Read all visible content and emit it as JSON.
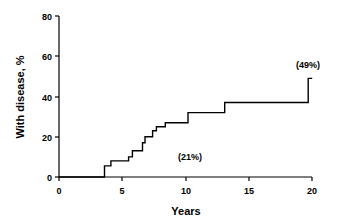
{
  "chart_data": {
    "type": "line",
    "subtype": "step",
    "title": "",
    "xlabel": "Years",
    "ylabel": "With disease, %",
    "xlim": [
      0,
      20
    ],
    "ylim": [
      0,
      80
    ],
    "xticks": [
      0,
      5,
      10,
      15,
      20
    ],
    "yticks": [
      0,
      20,
      40,
      60,
      80
    ],
    "grid": false,
    "legend": null,
    "series": [
      {
        "name": "Cumulative incidence",
        "x": [
          0,
          3.6,
          4.1,
          5.5,
          5.8,
          6.6,
          6.8,
          7.4,
          7.7,
          8.4,
          10.2,
          13.1,
          19.7,
          19.7
        ],
        "y": [
          0,
          5.5,
          8,
          10,
          13,
          17,
          20,
          23,
          25,
          27,
          32,
          37,
          37,
          49
        ]
      }
    ],
    "annotations": [
      {
        "text": "(21%)",
        "x": 10.2,
        "y": 21
      },
      {
        "text": "(49%)",
        "x": 19.7,
        "y": 53
      }
    ],
    "color": "#000000"
  },
  "labels": {
    "xlabel": "Years",
    "ylabel": "With disease, %",
    "annot1": "(21%)",
    "annot2": "(49%)",
    "xt0": "0",
    "xt1": "5",
    "xt2": "10",
    "xt3": "15",
    "xt4": "20",
    "yt0": "0",
    "yt1": "20",
    "yt2": "40",
    "yt3": "60",
    "yt4": "80"
  }
}
